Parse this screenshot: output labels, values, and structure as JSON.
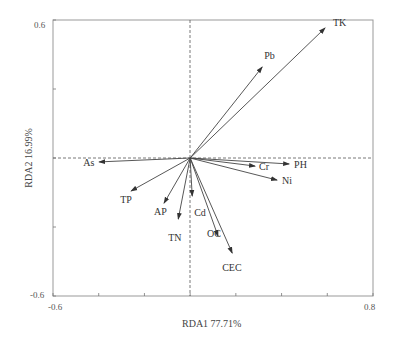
{
  "chart_data": {
    "type": "biplot",
    "title": "",
    "xlabel": "RDA1 77.71%",
    "ylabel": "RDA2 16.99%",
    "xlim": [
      -0.6,
      0.8
    ],
    "ylim": [
      -0.6,
      0.6
    ],
    "x_tick_labels": [
      "-0.6",
      "0.8"
    ],
    "y_tick_labels": [
      "0.6",
      "-0.6"
    ],
    "x_ticks": [
      -0.6,
      -0.4,
      -0.2,
      0,
      0.2,
      0.4,
      0.6,
      0.8
    ],
    "y_ticks": [
      -0.6,
      -0.3,
      0,
      0.3,
      0.6
    ],
    "grid": false,
    "reference_lines": {
      "x": 0,
      "y": 0,
      "style": "dashed"
    },
    "vectors": [
      {
        "name": "TK",
        "x": 0.59,
        "y": 0.565
      },
      {
        "name": "Pb",
        "x": 0.315,
        "y": 0.395
      },
      {
        "name": "PH",
        "x": 0.433,
        "y": -0.026
      },
      {
        "name": "Cr",
        "x": 0.284,
        "y": -0.035
      },
      {
        "name": "Ni",
        "x": 0.38,
        "y": -0.096
      },
      {
        "name": "As",
        "x": -0.398,
        "y": -0.017
      },
      {
        "name": "TP",
        "x": -0.258,
        "y": -0.143
      },
      {
        "name": "AP",
        "x": -0.114,
        "y": -0.196
      },
      {
        "name": "TN",
        "x": -0.052,
        "y": -0.265
      },
      {
        "name": "Cd",
        "x": 0.009,
        "y": -0.165
      },
      {
        "name": "OC",
        "x": 0.122,
        "y": -0.339
      },
      {
        "name": "CEC",
        "x": 0.184,
        "y": -0.413
      }
    ]
  },
  "labels": {
    "xlabel": "RDA1 77.71%",
    "ylabel": "RDA2 16.99%",
    "x_min": "-0.6",
    "x_max": "0.8",
    "y_max": "0.6",
    "y_min": "-0.6"
  },
  "vector_labels": {
    "TK": {
      "text": "TK",
      "dx": 8,
      "dy": -2
    },
    "Pb": {
      "text": "Pb",
      "dx": 2,
      "dy": -8
    },
    "PH": {
      "text": "PH",
      "dx": 5,
      "dy": 4
    },
    "Cr": {
      "text": "Cr",
      "dx": 4,
      "dy": 4
    },
    "Ni": {
      "text": "Ni",
      "dx": 5,
      "dy": 4
    },
    "As": {
      "text": "As",
      "dx": -16,
      "dy": 4
    },
    "TP": {
      "text": "TP",
      "dx": -11,
      "dy": 12
    },
    "AP": {
      "text": "AP",
      "dx": -10,
      "dy": 12
    },
    "TN": {
      "text": "TN",
      "dx": -10,
      "dy": 22
    },
    "Cd": {
      "text": "Cd",
      "dx": 2,
      "dy": 20
    },
    "OC": {
      "text": "OC",
      "dx": -11,
      "dy": 1
    },
    "CEC": {
      "text": "CEC",
      "dx": -10,
      "dy": 18
    }
  },
  "colors": {
    "axis": "#888888",
    "vector": "#444444",
    "text": "#333333"
  }
}
